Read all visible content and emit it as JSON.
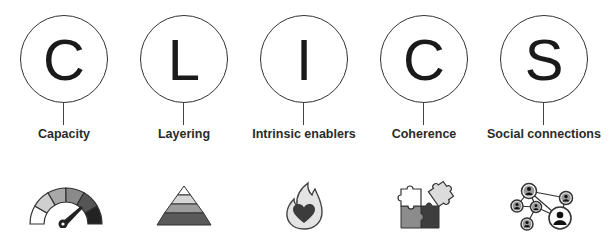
{
  "items": [
    {
      "letter": "C",
      "label": "Capacity",
      "icon": "gauge-icon"
    },
    {
      "letter": "L",
      "label": "Layering",
      "icon": "layered-pyramid-icon"
    },
    {
      "letter": "I",
      "label": "Intrinsic enablers",
      "icon": "flame-heart-icon"
    },
    {
      "letter": "C",
      "label": "Coherence",
      "icon": "puzzle-pieces-icon"
    },
    {
      "letter": "S",
      "label": "Social connections",
      "icon": "people-network-icon"
    }
  ],
  "colors": {
    "outline": "#333333",
    "text": "#1a1a1a",
    "shade_1": "#f4f4f4",
    "shade_2": "#c8c8c8",
    "shade_3": "#9a9a9a",
    "shade_4": "#6a6a6a",
    "shade_5": "#333333"
  }
}
